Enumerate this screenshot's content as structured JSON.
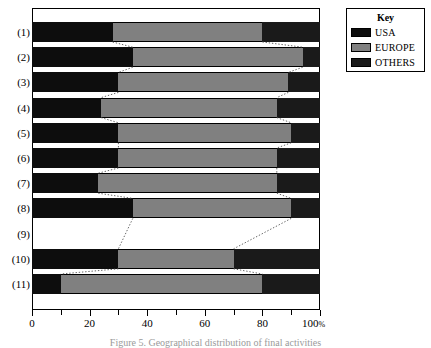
{
  "figure": {
    "caption": "Figure 5. Geographical distribution of final activities"
  },
  "legend": {
    "title": "Key",
    "items": [
      {
        "label": "USA",
        "color": "#0d0d0d",
        "icon": "swatch-icon"
      },
      {
        "label": "EUROPE",
        "color": "#808080",
        "icon": "swatch-icon"
      },
      {
        "label": "OTHERS",
        "color": "#1a1a1a",
        "icon": "swatch-icon"
      }
    ]
  },
  "axis": {
    "label": "100%",
    "percent_suffix": "%",
    "ticks": [
      {
        "value": 0,
        "label": "0",
        "major": true
      },
      {
        "value": 10,
        "label": "",
        "major": false
      },
      {
        "value": 20,
        "label": "20",
        "major": true
      },
      {
        "value": 30,
        "label": "",
        "major": false
      },
      {
        "value": 40,
        "label": "40",
        "major": true
      },
      {
        "value": 50,
        "label": "",
        "major": false
      },
      {
        "value": 60,
        "label": "60",
        "major": true
      },
      {
        "value": 70,
        "label": "",
        "major": false
      },
      {
        "value": 80,
        "label": "80",
        "major": true
      },
      {
        "value": 90,
        "label": "",
        "major": false
      },
      {
        "value": 100,
        "label": "100",
        "major": true
      }
    ]
  },
  "chart_data": {
    "type": "bar",
    "orientation": "horizontal",
    "stacked": true,
    "normalized": true,
    "title": "",
    "xlabel": "",
    "ylabel": "",
    "xlim": [
      0,
      100
    ],
    "grid": false,
    "legend_position": "top-right",
    "categories": [
      "(1)",
      "(2)",
      "(3)",
      "(4)",
      "(5)",
      "(6)",
      "(7)",
      "(8)",
      "(9)",
      "(10)",
      "(11)"
    ],
    "series": [
      {
        "name": "USA",
        "color": "#0d0d0d",
        "values": [
          28,
          35,
          30,
          24,
          30,
          30,
          23,
          35,
          null,
          30,
          10
        ]
      },
      {
        "name": "EUROPE",
        "color": "#808080",
        "values": [
          52,
          59,
          59,
          61,
          60,
          55,
          62,
          55,
          null,
          40,
          70
        ]
      },
      {
        "name": "OTHERS",
        "color": "#1a1a1a",
        "values": [
          20,
          6,
          11,
          15,
          10,
          15,
          15,
          10,
          null,
          30,
          20
        ]
      }
    ],
    "cumulative_boundaries": [
      {
        "category": "(1)",
        "b1": 28,
        "b2": 80,
        "empty": false
      },
      {
        "category": "(2)",
        "b1": 35,
        "b2": 94,
        "empty": false
      },
      {
        "category": "(3)",
        "b1": 30,
        "b2": 89,
        "empty": false
      },
      {
        "category": "(4)",
        "b1": 24,
        "b2": 85,
        "empty": false
      },
      {
        "category": "(5)",
        "b1": 30,
        "b2": 90,
        "empty": false
      },
      {
        "category": "(6)",
        "b1": 30,
        "b2": 85,
        "empty": false
      },
      {
        "category": "(7)",
        "b1": 23,
        "b2": 85,
        "empty": false
      },
      {
        "category": "(8)",
        "b1": 35,
        "b2": 90,
        "empty": false
      },
      {
        "category": "(9)",
        "b1": null,
        "b2": null,
        "empty": true
      },
      {
        "category": "(10)",
        "b1": 30,
        "b2": 70,
        "empty": false
      },
      {
        "category": "(11)",
        "b1": 10,
        "b2": 80,
        "empty": false
      }
    ]
  }
}
